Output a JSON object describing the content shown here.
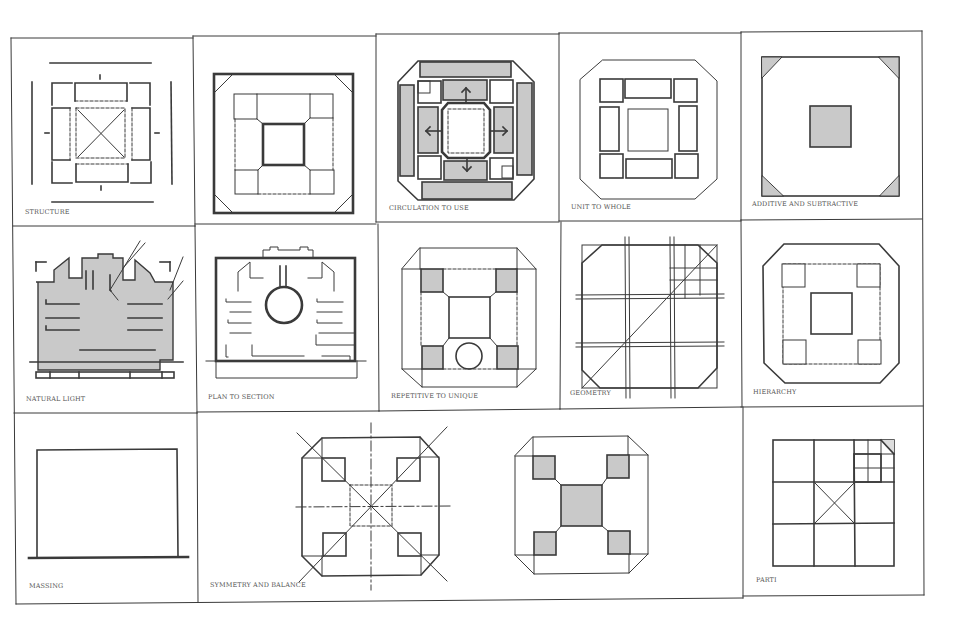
{
  "sheet": {
    "title": "",
    "background": "#ffffff",
    "line_color": "#3a3a3a",
    "fill_gray": "#c9c9c9"
  },
  "cells": [
    {
      "id": "structure",
      "label": "STRUCTURE"
    },
    {
      "id": "plan-frame",
      "label": ""
    },
    {
      "id": "circulation-to-use",
      "label": "CIRCULATION TO USE"
    },
    {
      "id": "unit-to-whole",
      "label": "UNIT TO WHOLE"
    },
    {
      "id": "additive-and-subtractive",
      "label": "ADDITIVE AND SUBTRACTIVE"
    },
    {
      "id": "natural-light",
      "label": "NATURAL LIGHT"
    },
    {
      "id": "plan-to-section",
      "label": "PLAN TO SECTION"
    },
    {
      "id": "repetitive-to-unique",
      "label": "REPETITIVE TO UNIQUE"
    },
    {
      "id": "geometry",
      "label": "GEOMETRY"
    },
    {
      "id": "hierarchy",
      "label": "HIERARCHY"
    },
    {
      "id": "massing",
      "label": "MASSING"
    },
    {
      "id": "symmetry-and-balance",
      "label": "SYMMETRY AND BALANCE"
    },
    {
      "id": "parti",
      "label": "PARTI"
    }
  ]
}
